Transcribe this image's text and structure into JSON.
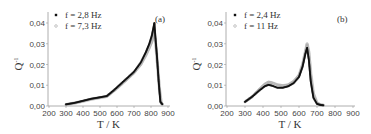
{
  "chart_data": [
    {
      "type": "scatter",
      "panel_label": "(a)",
      "title": "",
      "xlabel": "T / K",
      "ylabel": "Q⁻¹",
      "xlim": [
        200,
        900
      ],
      "ylim": [
        0.0,
        0.044
      ],
      "xticks": [
        "200",
        "300",
        "400",
        "500",
        "600",
        "700",
        "800",
        "900"
      ],
      "yticks": [
        "0,00",
        "0,01",
        "0,02",
        "0,03",
        "0,04"
      ],
      "grid": false,
      "legend_position": "upper-left",
      "series": [
        {
          "name": "f = 2,8 Hz",
          "marker": "filled-square",
          "color": "#111111",
          "x": [
            300,
            350,
            400,
            450,
            500,
            540,
            580,
            620,
            660,
            700,
            740,
            770,
            790,
            805,
            815,
            820,
            825,
            835,
            845,
            855,
            870
          ],
          "y": [
            0.0008,
            0.0015,
            0.0025,
            0.0035,
            0.0042,
            0.0048,
            0.0075,
            0.0105,
            0.0135,
            0.0165,
            0.021,
            0.026,
            0.03,
            0.034,
            0.038,
            0.04,
            0.034,
            0.024,
            0.012,
            0.002,
            0.0005
          ]
        },
        {
          "name": "f = 7,3 Hz",
          "marker": "open-circle",
          "color": "#aaaaaa",
          "x": [
            300,
            350,
            400,
            450,
            500,
            540,
            580,
            620,
            660,
            700,
            740,
            770,
            790,
            805,
            815,
            820,
            830,
            840,
            850,
            860,
            870
          ],
          "y": [
            0.0007,
            0.0014,
            0.0023,
            0.0033,
            0.004,
            0.0046,
            0.0072,
            0.01,
            0.013,
            0.016,
            0.02,
            0.0245,
            0.028,
            0.031,
            0.034,
            0.036,
            0.028,
            0.018,
            0.008,
            0.0015,
            0.0005
          ]
        }
      ]
    },
    {
      "type": "scatter",
      "panel_label": "(b)",
      "title": "",
      "xlabel": "T / K",
      "ylabel": "Q⁻¹",
      "xlim": [
        200,
        900
      ],
      "ylim": [
        0.0,
        0.044
      ],
      "xticks": [
        "200",
        "300",
        "400",
        "500",
        "600",
        "700",
        "800",
        "900"
      ],
      "yticks": [
        "0,00",
        "0,01",
        "0,02",
        "0,03",
        "0,04"
      ],
      "grid": false,
      "legend_position": "upper-left",
      "series": [
        {
          "name": "f = 2,4 Hz",
          "marker": "filled-square",
          "color": "#111111",
          "x": [
            300,
            340,
            380,
            410,
            430,
            450,
            480,
            510,
            540,
            570,
            600,
            620,
            635,
            645,
            655,
            665,
            680,
            700,
            720,
            740
          ],
          "y": [
            0.002,
            0.0045,
            0.0075,
            0.0095,
            0.0102,
            0.0098,
            0.0088,
            0.0088,
            0.0095,
            0.011,
            0.014,
            0.019,
            0.025,
            0.028,
            0.022,
            0.012,
            0.004,
            0.001,
            0.0005,
            0.0003
          ]
        },
        {
          "name": "f = 11 Hz",
          "marker": "open-circle",
          "color": "#aaaaaa",
          "x": [
            300,
            340,
            380,
            410,
            430,
            450,
            480,
            510,
            540,
            570,
            600,
            620,
            635,
            645,
            655,
            665,
            680,
            700,
            720,
            740
          ],
          "y": [
            0.002,
            0.0045,
            0.008,
            0.0105,
            0.0115,
            0.0112,
            0.0102,
            0.0098,
            0.0102,
            0.0118,
            0.0148,
            0.02,
            0.026,
            0.03,
            0.026,
            0.016,
            0.006,
            0.0015,
            0.0006,
            0.0003
          ]
        }
      ]
    }
  ]
}
